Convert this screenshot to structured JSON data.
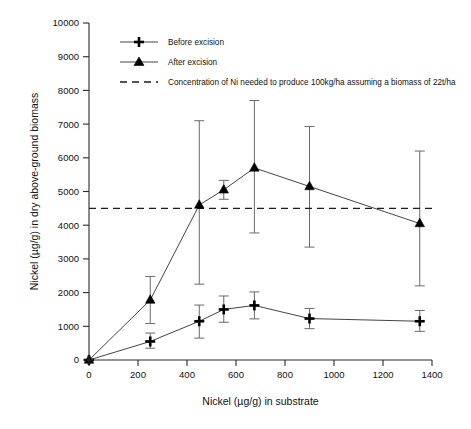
{
  "chart_data": {
    "type": "line",
    "title": "",
    "xlabel": "Nickel (µg/g) in substrate",
    "ylabel": "Nickel (µg/g) in dry above-ground biomass",
    "xlim": [
      0,
      1400
    ],
    "ylim": [
      0,
      10000
    ],
    "xticks": [
      0,
      200,
      400,
      600,
      800,
      1000,
      1200,
      1400
    ],
    "yticks": [
      0,
      1000,
      2000,
      3000,
      4000,
      5000,
      6000,
      7000,
      8000,
      9000,
      10000
    ],
    "grid": false,
    "legend_position": "top-left-inside",
    "series": [
      {
        "name": "Before excision",
        "marker": "plus",
        "x": [
          0,
          250,
          450,
          550,
          675,
          900,
          1350
        ],
        "values": [
          0,
          550,
          1150,
          1500,
          1620,
          1230,
          1150
        ],
        "err_low": [
          0,
          200,
          500,
          380,
          400,
          300,
          300
        ],
        "err_high": [
          0,
          250,
          480,
          400,
          400,
          300,
          320
        ]
      },
      {
        "name": "After excision",
        "marker": "triangle",
        "x": [
          0,
          250,
          450,
          550,
          675,
          900,
          1350
        ],
        "values": [
          0,
          1780,
          4600,
          5050,
          5700,
          5150,
          4050
        ],
        "err_low": [
          0,
          700,
          2350,
          280,
          1930,
          1800,
          1850
        ],
        "err_high": [
          0,
          700,
          2500,
          280,
          2000,
          1780,
          2150
        ]
      }
    ],
    "reference_line": {
      "name": "Concentration of Ni needed to produce 100kg/ha assuming a biomass of 22t/ha",
      "value": 4500,
      "style": "dashed"
    },
    "legend": [
      {
        "label": "Before excision",
        "marker": "plus"
      },
      {
        "label": "After excision",
        "marker": "triangle"
      },
      {
        "label": "Concentration of Ni needed to produce 100kg/ha assuming a biomass of 22t/ha",
        "marker": "dashed-line"
      }
    ]
  }
}
